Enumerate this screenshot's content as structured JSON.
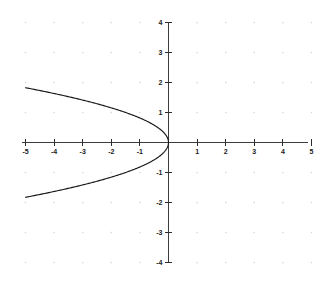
{
  "chart_data": {
    "type": "line",
    "title": "",
    "subtitle": "",
    "xlabel": "",
    "ylabel": "",
    "xlim": [
      -5,
      5
    ],
    "ylim": [
      -4,
      4
    ],
    "grid": "dots at integer intersections",
    "legend": "none",
    "legend_position": "none",
    "equation": "x = -1.5 * y^2",
    "x_ticks": [
      -5,
      -4,
      -3,
      -2,
      -1,
      1,
      2,
      3,
      4,
      5
    ],
    "x_tick_labels": [
      "-5",
      "-4",
      "-3",
      "-2",
      "-1",
      "1",
      "2",
      "3",
      "4",
      "5"
    ],
    "y_ticks": [
      -4,
      -3,
      -2,
      -1,
      1,
      2,
      3,
      4
    ],
    "y_tick_labels": [
      "-4",
      "-3",
      "-2",
      "-1",
      "1",
      "2",
      "3",
      "4"
    ],
    "series": [
      {
        "name": "x = -1.5y^2",
        "points": [
          [
            -5.0,
            1.826
          ],
          [
            -4.5,
            1.732
          ],
          [
            -4.0,
            1.633
          ],
          [
            -3.5,
            1.528
          ],
          [
            -3.0,
            1.414
          ],
          [
            -2.5,
            1.291
          ],
          [
            -2.0,
            1.155
          ],
          [
            -1.5,
            1.0
          ],
          [
            -1.0,
            0.816
          ],
          [
            -0.6,
            0.632
          ],
          [
            -0.3,
            0.447
          ],
          [
            -0.1,
            0.258
          ],
          [
            0.0,
            0.0
          ],
          [
            -0.1,
            -0.258
          ],
          [
            -0.3,
            -0.447
          ],
          [
            -0.6,
            -0.632
          ],
          [
            -1.0,
            -0.816
          ],
          [
            -1.5,
            -1.0
          ],
          [
            -2.0,
            -1.155
          ],
          [
            -2.5,
            -1.291
          ],
          [
            -3.0,
            -1.414
          ],
          [
            -3.5,
            -1.528
          ],
          [
            -4.0,
            -1.633
          ],
          [
            -4.5,
            -1.732
          ],
          [
            -5.0,
            -1.826
          ]
        ]
      }
    ],
    "axis_color": "#3d3d3d",
    "curve_color": "#171717",
    "grid_color": "#d8d8dc",
    "background_color": "#ffffff"
  }
}
